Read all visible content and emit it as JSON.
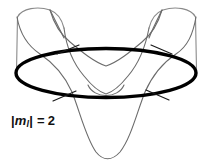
{
  "figure": {
    "kind": "orbital-angular-momentum-diagram",
    "background_color": "#ffffff",
    "label": {
      "full_text": "|ml| = 2",
      "bar_left": "|",
      "symbol": "m",
      "subscript": "l",
      "bar_right": "|",
      "equals": "=",
      "value": "2"
    },
    "colors": {
      "node_circle": "#000000",
      "wave_curve": "#6b6b6b",
      "cylinder_edge": "#8a8a8a",
      "node_tick": "#1a1a1a",
      "label_text": "#111111"
    },
    "elements": {
      "node_circle_label": "bold horizontal node ellipse",
      "wave_curve_label": "standing wave curve around cylinder",
      "cylinder_edge_label": "cylinder silhouette edge",
      "node_tick_label": "angular node marker",
      "inner_arc_label": "inner shallow arc"
    },
    "node_ticks": [
      {
        "x": 68,
        "y": 49,
        "angle": -28
      },
      {
        "x": 161,
        "y": 49,
        "angle": 28
      },
      {
        "x": 64,
        "y": 96,
        "angle": -30
      },
      {
        "x": 157,
        "y": 95,
        "angle": 30
      }
    ],
    "geometry": {
      "ellipse_center_x": 106,
      "ellipse_center_y": 73,
      "ellipse_rx": 91,
      "ellipse_ry": 25,
      "ellipse_stroke_width": 3.4,
      "wave_stroke_width": 1.1,
      "cylinder_left_x": 17,
      "cylinder_right_x": 196,
      "cylinder_top_y": 14,
      "bottom_lobe_y": 161
    }
  }
}
